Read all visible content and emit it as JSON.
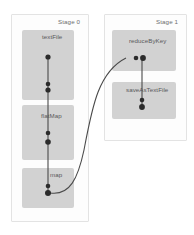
{
  "diagram": {
    "type": "dag",
    "background_color": "#ffffff",
    "node_fill_color": "#d2d2d2",
    "stage_border_color": "#e3e3e3",
    "dot_color": "#2b2b2b",
    "edge_color": "#4a4a4a"
  },
  "stages": [
    {
      "id": "stage0",
      "label": "Stage 0",
      "nodes": [
        {
          "id": "textFile",
          "label": "textFile",
          "dots": 3
        },
        {
          "id": "flatMap",
          "label": "flatMap",
          "dots": 2
        },
        {
          "id": "map",
          "label": "map",
          "dots": 2
        }
      ]
    },
    {
      "id": "stage1",
      "label": "Stage 1",
      "nodes": [
        {
          "id": "reduceByKey",
          "label": "reduceByKey",
          "dots": 2
        },
        {
          "id": "saveAsTextFile",
          "label": "saveAsTextFile",
          "dots": 2
        }
      ]
    }
  ],
  "edges": [
    {
      "from": "textFile",
      "to": "flatMap",
      "kind": "narrow"
    },
    {
      "from": "flatMap",
      "to": "map",
      "kind": "narrow"
    },
    {
      "from": "map",
      "to": "reduceByKey",
      "kind": "shuffle"
    },
    {
      "from": "reduceByKey",
      "to": "saveAsTextFile",
      "kind": "narrow"
    }
  ]
}
